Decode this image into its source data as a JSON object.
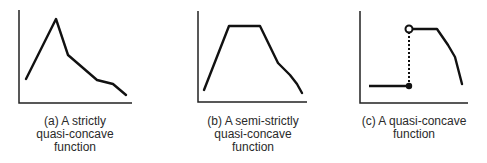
{
  "panels": [
    {
      "id": "a",
      "caption_lines": [
        "(a) A strictly",
        "quasi-concave",
        "function"
      ],
      "axes": {
        "origin": [
          19,
          103
        ],
        "y_top": 10,
        "x_end": 132
      },
      "curve": [
        [
          26,
          79
        ],
        [
          56,
          19
        ],
        [
          68,
          55
        ],
        [
          97,
          80
        ],
        [
          113,
          84
        ],
        [
          126,
          95
        ]
      ]
    },
    {
      "id": "b",
      "caption_lines": [
        "(b) A semi-strictly",
        "quasi-concave",
        "function"
      ],
      "axes": {
        "origin": [
          198,
          102
        ],
        "y_top": 11,
        "x_end": 307
      },
      "curve": [
        [
          204,
          90
        ],
        [
          229,
          26
        ],
        [
          260,
          26
        ],
        [
          278,
          63
        ],
        [
          290,
          75
        ],
        [
          297,
          84
        ],
        [
          302,
          93
        ]
      ]
    },
    {
      "id": "c",
      "caption_lines": [
        "(c) A quasi-concave",
        "function"
      ],
      "axes": {
        "origin": [
          360,
          103
        ],
        "y_top": 11,
        "x_end": 468
      },
      "low_segment": [
        [
          369,
          86
        ],
        [
          409,
          86
        ]
      ],
      "filled_dot": [
        409,
        86
      ],
      "dotted_jump": [
        [
          409,
          86
        ],
        [
          409,
          33
        ]
      ],
      "open_circle": [
        409,
        29
      ],
      "curve": [
        [
          412,
          29
        ],
        [
          437,
          29
        ],
        [
          448,
          45
        ],
        [
          455,
          57
        ],
        [
          462,
          84
        ]
      ]
    }
  ],
  "colors": {
    "line": "#111111",
    "axis": "#222222",
    "text": "#2a2a2a"
  }
}
